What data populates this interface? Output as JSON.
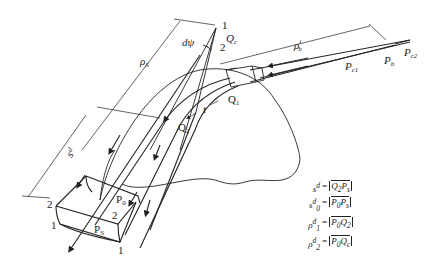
{
  "figure": {
    "type": "ray-tube diffraction geometry diagram",
    "labels": {
      "point_1_top": "1",
      "point_2_top": "2",
      "Qc": "Q",
      "Qc_sub": "c",
      "dpsi": "dψ",
      "rho_s": "ρ",
      "rho_s_sub": "S",
      "s_d": "s",
      "s_d_sup": "d",
      "rho_b": "ρ",
      "rho_b_sub": "b",
      "rho_b_sup": "i",
      "Pc1": "P",
      "Pc1_sub": "c1",
      "Pb": "P",
      "Pb_sub": "b",
      "Pc2": "P",
      "Pc2_sub": "c2",
      "Q1": "Q",
      "Q1_sub": "1",
      "Q2": "Q",
      "Q2_sub": "2",
      "t": "t",
      "P0": "P",
      "P0_sub": "0",
      "Ps": "P",
      "Ps_sub": "S",
      "corner_2_left": "2",
      "corner_1_left": "1",
      "corner_2_right": "2",
      "corner_1_bottom": "1"
    }
  },
  "legend": [
    {
      "lhs": "s",
      "lhs_sup": "d",
      "lhs_sub": "",
      "eq": "=",
      "a": "Q",
      "a_sub": "2",
      "b": "P",
      "b_sub": "s"
    },
    {
      "lhs": "s",
      "lhs_sup": "d",
      "lhs_sub": "0",
      "eq": "=",
      "a": "P",
      "a_sub": "0",
      "b": "P",
      "b_sub": "s"
    },
    {
      "lhs": "ρ",
      "lhs_sup": "d",
      "lhs_sub": "1",
      "eq": "=",
      "a": "P",
      "a_sub": "0",
      "b": "Q",
      "b_sub": "2"
    },
    {
      "lhs": "ρ",
      "lhs_sup": "d",
      "lhs_sub": "2",
      "eq": "=",
      "a": "P",
      "a_sub": "0",
      "b": "Q",
      "b_sub": "c"
    }
  ],
  "colors": {
    "ink": "#222222",
    "background": "#ffffff"
  }
}
